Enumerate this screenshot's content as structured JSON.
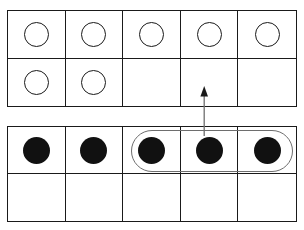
{
  "diagram": {
    "colors": {
      "frame_line": "#1a1a1a",
      "counter_fill": "#111111",
      "counter_outline": "#1a1a1a",
      "loop_stroke": "#6e6e6e",
      "arrow_stroke": "#6e6e6e",
      "background": "#ffffff"
    },
    "columns": 5,
    "rows": 2
  },
  "top_frame": {
    "name": "top-ten-frame",
    "counter_style": "open",
    "total_counters": 7,
    "cells": [
      {
        "row": 1,
        "col": 1,
        "state": "open"
      },
      {
        "row": 1,
        "col": 2,
        "state": "open"
      },
      {
        "row": 1,
        "col": 3,
        "state": "open"
      },
      {
        "row": 1,
        "col": 4,
        "state": "open"
      },
      {
        "row": 1,
        "col": 5,
        "state": "open"
      },
      {
        "row": 2,
        "col": 1,
        "state": "open"
      },
      {
        "row": 2,
        "col": 2,
        "state": "open"
      },
      {
        "row": 2,
        "col": 3,
        "state": "empty"
      },
      {
        "row": 2,
        "col": 4,
        "state": "empty"
      },
      {
        "row": 2,
        "col": 5,
        "state": "empty"
      }
    ]
  },
  "bottom_frame": {
    "name": "bottom-ten-frame",
    "counter_style": "filled",
    "total_counters": 5,
    "cells": [
      {
        "row": 1,
        "col": 1,
        "state": "filled"
      },
      {
        "row": 1,
        "col": 2,
        "state": "filled"
      },
      {
        "row": 1,
        "col": 3,
        "state": "filled"
      },
      {
        "row": 1,
        "col": 4,
        "state": "filled"
      },
      {
        "row": 1,
        "col": 5,
        "state": "filled"
      },
      {
        "row": 2,
        "col": 1,
        "state": "empty"
      },
      {
        "row": 2,
        "col": 2,
        "state": "empty"
      },
      {
        "row": 2,
        "col": 3,
        "state": "empty"
      },
      {
        "row": 2,
        "col": 4,
        "state": "empty"
      },
      {
        "row": 2,
        "col": 5,
        "state": "empty"
      }
    ]
  },
  "group_loop": {
    "name": "group-loop",
    "encircles_frame": "bottom_frame",
    "encircles_row": 1,
    "encircles_columns": [
      3,
      4,
      5
    ],
    "counters_grouped": 3,
    "shape": "rounded-rectangle"
  },
  "arrow": {
    "name": "move-arrow",
    "direction": "up",
    "from_frame": "bottom_frame",
    "to_frame": "top_frame",
    "to_cell": {
      "row": 2,
      "col": 4
    }
  }
}
